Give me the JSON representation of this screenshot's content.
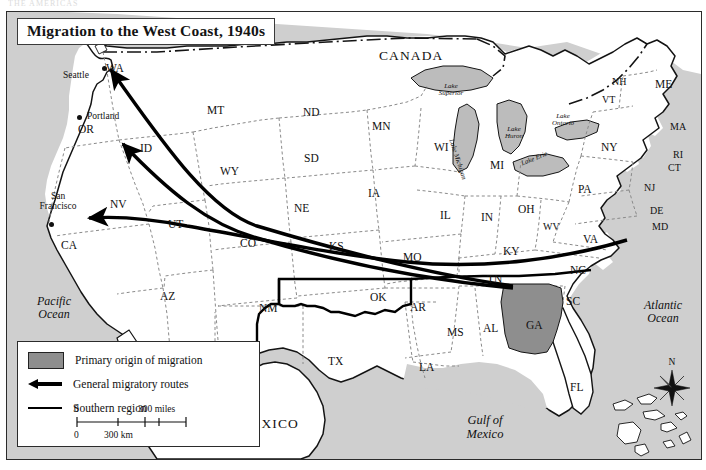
{
  "scan": {
    "header_text": "THE  AMERICAS"
  },
  "map": {
    "title": "Migration to the West Coast, 1940s",
    "countries": [
      {
        "name": "CANADA",
        "x": 372,
        "y": 36
      },
      {
        "name": "MEXICO",
        "x": 232,
        "y": 404
      }
    ],
    "oceans": [
      {
        "name": "Pacific\nOcean",
        "line1": "Pacific",
        "line2": "Ocean",
        "x": 16,
        "y": 283
      },
      {
        "name": "Atlantic\nOcean",
        "line1": "Atlantic",
        "line2": "Ocean",
        "x": 625,
        "y": 287
      },
      {
        "name": "Gulf of Mexico",
        "line1": "Gulf of",
        "line2": "Mexico",
        "x": 447,
        "y": 403
      }
    ],
    "lakes": [
      {
        "label": "Lake Superior",
        "line1": "Lake",
        "line2": "Superior",
        "x": 433,
        "y": 72
      },
      {
        "label": "Lake Michigan",
        "line1": "Lake Michigan",
        "x": 466,
        "y": 128
      },
      {
        "label": "Lake Huron",
        "line1": "Lake",
        "line2": "Huron",
        "x": 504,
        "y": 118
      },
      {
        "label": "Lake Erie",
        "line1": "Lake Erie",
        "x": 524,
        "y": 152
      },
      {
        "label": "Lake Ontario",
        "line1": "Lake",
        "line2": "Ontario",
        "x": 551,
        "y": 104
      }
    ],
    "cities": [
      {
        "name": "Seattle",
        "x": 63,
        "y": 60,
        "dot_x": 95,
        "dot_y": 54
      },
      {
        "name": "Portland",
        "x": 80,
        "y": 104,
        "dot_x": 72,
        "dot_y": 105
      },
      {
        "name": "San\nFrancisco",
        "line1": "San",
        "line2": "Francisco",
        "x": 31,
        "y": 186,
        "dot_x": 38,
        "dot_y": 213
      },
      {
        "name": "Georgia marker",
        "line1": "",
        "line2": "",
        "x": 0,
        "y": 0,
        "dot_x": 0,
        "dot_y": 0
      }
    ],
    "states": [
      {
        "abbr": "WA",
        "x": 106,
        "y": 56
      },
      {
        "abbr": "OR",
        "x": 78,
        "y": 117
      },
      {
        "abbr": "ID",
        "x": 140,
        "y": 136
      },
      {
        "abbr": "MT",
        "x": 207,
        "y": 98
      },
      {
        "abbr": "ND",
        "x": 303,
        "y": 100
      },
      {
        "abbr": "MN",
        "x": 372,
        "y": 114
      },
      {
        "abbr": "WI",
        "x": 434,
        "y": 135
      },
      {
        "abbr": "SD",
        "x": 304,
        "y": 146
      },
      {
        "abbr": "WY",
        "x": 220,
        "y": 159
      },
      {
        "abbr": "NV",
        "x": 110,
        "y": 192
      },
      {
        "abbr": "UT",
        "x": 168,
        "y": 212
      },
      {
        "abbr": "CO",
        "x": 240,
        "y": 231
      },
      {
        "abbr": "NE",
        "x": 294,
        "y": 196
      },
      {
        "abbr": "IA",
        "x": 368,
        "y": 181
      },
      {
        "abbr": "IL",
        "x": 440,
        "y": 203
      },
      {
        "abbr": "IN",
        "x": 481,
        "y": 205
      },
      {
        "abbr": "MI",
        "x": 490,
        "y": 153
      },
      {
        "abbr": "OH",
        "x": 518,
        "y": 197
      },
      {
        "abbr": "PA",
        "x": 578,
        "y": 177
      },
      {
        "abbr": "NY",
        "x": 601,
        "y": 135
      },
      {
        "abbr": "NH",
        "x": 612,
        "y": 70
      },
      {
        "abbr": "VT",
        "x": 602,
        "y": 88
      },
      {
        "abbr": "ME",
        "x": 655,
        "y": 72
      },
      {
        "abbr": "MA",
        "x": 670,
        "y": 115
      },
      {
        "abbr": "RI",
        "x": 673,
        "y": 143
      },
      {
        "abbr": "CT",
        "x": 668,
        "y": 156
      },
      {
        "abbr": "NJ",
        "x": 644,
        "y": 176
      },
      {
        "abbr": "DE",
        "x": 650,
        "y": 199
      },
      {
        "abbr": "MD",
        "x": 652,
        "y": 215
      },
      {
        "abbr": "WV",
        "x": 543,
        "y": 215
      },
      {
        "abbr": "VA",
        "x": 583,
        "y": 227
      },
      {
        "abbr": "KS",
        "x": 329,
        "y": 234
      },
      {
        "abbr": "MO",
        "x": 403,
        "y": 245
      },
      {
        "abbr": "KY",
        "x": 503,
        "y": 239
      },
      {
        "abbr": "TN",
        "x": 487,
        "y": 267
      },
      {
        "abbr": "NC",
        "x": 570,
        "y": 258
      },
      {
        "abbr": "SC",
        "x": 566,
        "y": 289
      },
      {
        "abbr": "GA",
        "x": 526,
        "y": 313
      },
      {
        "abbr": "AL",
        "x": 483,
        "y": 316
      },
      {
        "abbr": "MS",
        "x": 447,
        "y": 320
      },
      {
        "abbr": "AR",
        "x": 410,
        "y": 295
      },
      {
        "abbr": "LA",
        "x": 419,
        "y": 355
      },
      {
        "abbr": "OK",
        "x": 370,
        "y": 285
      },
      {
        "abbr": "TX",
        "x": 328,
        "y": 349
      },
      {
        "abbr": "NM",
        "x": 259,
        "y": 296
      },
      {
        "abbr": "AZ",
        "x": 160,
        "y": 284
      },
      {
        "abbr": "CA",
        "x": 61,
        "y": 233
      },
      {
        "abbr": "FL",
        "x": 570,
        "y": 375
      }
    ],
    "compass": {
      "label": "N"
    },
    "legend": {
      "items": [
        {
          "symbol": "shaded-swatch",
          "label": "Primary origin of migration"
        },
        {
          "symbol": "arrow",
          "label": "General migratory routes"
        },
        {
          "symbol": "line",
          "label": "Southern region"
        }
      ],
      "scale_miles": {
        "start": "0",
        "end": "300 miles"
      },
      "scale_km": {
        "start": "0",
        "end": "300 km"
      }
    },
    "colors": {
      "ocean_fill": "#cfcfcf",
      "land_fill": "#ffffff",
      "primary_origin_fill": "#8e8e8e",
      "lake_fill": "#bcbcbc",
      "border": "#141414",
      "state_border": "#8a8a8a",
      "route": "#000000"
    }
  }
}
